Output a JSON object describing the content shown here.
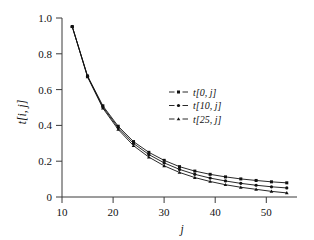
{
  "chart_data": {
    "type": "line",
    "title": "",
    "subtitle": "",
    "xlabel": "j",
    "ylabel": "t[i, j]",
    "xlim": [
      8,
      54
    ],
    "ylim": [
      0,
      1.05
    ],
    "grid": false,
    "legend_position": "center-right-upper",
    "x_ticks": [
      10,
      20,
      30,
      40,
      50
    ],
    "x_tick_labels": [
      "10",
      "20",
      "30",
      "40",
      "50"
    ],
    "y_ticks": [
      0,
      0.2,
      0.4,
      0.6,
      0.8,
      1.0
    ],
    "y_tick_labels": [
      "0",
      "0.2",
      "0.4",
      "0.6",
      "0.8",
      "1.0"
    ],
    "x": [
      10,
      13,
      16,
      19,
      22,
      25,
      28,
      31,
      34,
      37,
      40,
      43,
      46,
      49,
      52
    ],
    "series": [
      {
        "name": "t[0, j]",
        "marker": "square",
        "values": [
          1.0,
          0.71,
          0.535,
          0.415,
          0.325,
          0.262,
          0.215,
          0.178,
          0.152,
          0.133,
          0.118,
          0.106,
          0.097,
          0.089,
          0.083
        ]
      },
      {
        "name": "t[10, j]",
        "marker": "circle",
        "values": [
          1.0,
          0.707,
          0.528,
          0.406,
          0.314,
          0.249,
          0.2,
          0.162,
          0.133,
          0.111,
          0.094,
          0.08,
          0.069,
          0.06,
          0.053
        ]
      },
      {
        "name": "t[25, j]",
        "marker": "triangle",
        "values": [
          1.0,
          0.704,
          0.521,
          0.396,
          0.301,
          0.234,
          0.183,
          0.144,
          0.114,
          0.091,
          0.072,
          0.057,
          0.045,
          0.033,
          0.024
        ]
      }
    ]
  },
  "legend": {
    "entries": [
      {
        "label": "t[0, j]"
      },
      {
        "label": "t[10, j]"
      },
      {
        "label": "t[25, j]"
      }
    ]
  },
  "colors": {
    "axis": "#3a3a3a",
    "series": "#111111",
    "background": "#ffffff"
  }
}
